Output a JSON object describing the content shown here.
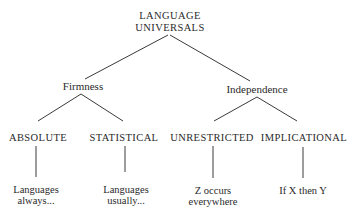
{
  "diagram": {
    "root": {
      "line1": "LANGUAGE",
      "line2": "UNIVERSALS"
    },
    "level1": [
      {
        "label": "Firmness"
      },
      {
        "label": "Independence"
      }
    ],
    "level2": [
      {
        "label": "ABSOLUTE",
        "leaf_line1": "Languages",
        "leaf_line2": "always..."
      },
      {
        "label": "STATISTICAL",
        "leaf_line1": "Languages",
        "leaf_line2": "usually..."
      },
      {
        "label": "UNRESTRICTED",
        "leaf_line1": "Z occurs",
        "leaf_line2": "everywhere"
      },
      {
        "label": "IMPLICATIONAL",
        "leaf_line1": "If X then Y",
        "leaf_line2": ""
      }
    ],
    "colors": {
      "text": "#2a2a2a",
      "lines": "#3a3a3a",
      "background": "#ffffff"
    }
  }
}
